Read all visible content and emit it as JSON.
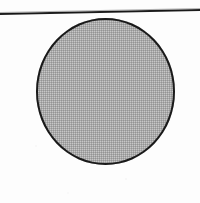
{
  "figure": {
    "background_color": "#fdfdfd",
    "elements": {
      "rule": {
        "name": "horizontal rule",
        "color": "#141414",
        "thickness_px": 2,
        "x_start_px": 0,
        "x_end_px": 200,
        "y_left_px": 13,
        "y_right_px": 9,
        "slant": "rises slightly toward the right"
      },
      "circle": {
        "name": "shaded circle",
        "fill_description": "50% dithered halftone gray",
        "fill_color": "#a9a9a9",
        "outline_color": "#1c1c1c",
        "outline_thickness_px": 2,
        "left_px": 36,
        "top_px": 18,
        "width_px": 139,
        "height_px": 147,
        "center_x_px": 105,
        "center_y_px": 92
      }
    }
  }
}
